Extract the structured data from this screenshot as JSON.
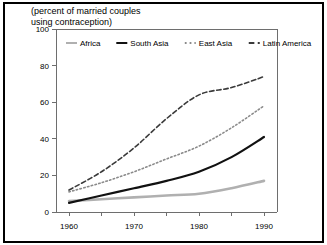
{
  "title": {
    "line1": "(percent of married couples",
    "line2": "using contraception)"
  },
  "chart_data": {
    "type": "line",
    "title": "(percent of married couples using contraception)",
    "xlabel": "",
    "ylabel": "",
    "xlim": [
      1958,
      1992
    ],
    "ylim": [
      0,
      100
    ],
    "grid": false,
    "legend_position": "top-inside",
    "x_ticks": [
      1960,
      1970,
      1980,
      1990
    ],
    "x_minor_ticks": [
      1965,
      1975,
      1985
    ],
    "y_ticks": [
      0,
      20,
      40,
      60,
      80,
      100
    ],
    "x": [
      1960,
      1965,
      1970,
      1975,
      1980,
      1985,
      1990
    ],
    "series": [
      {
        "name": "Africa",
        "style": "solid",
        "color": "#b0b0b0",
        "width": 2.6,
        "values": [
          6,
          7,
          8,
          9,
          10,
          13,
          17
        ]
      },
      {
        "name": "South Asia",
        "style": "solid",
        "color": "#111111",
        "width": 2.2,
        "values": [
          5,
          9,
          13,
          17,
          22,
          30,
          41
        ]
      },
      {
        "name": "East Asia",
        "style": "dotted",
        "color": "#8a8a8a",
        "width": 1.6,
        "values": [
          11,
          16,
          22,
          29,
          36,
          46,
          58
        ]
      },
      {
        "name": "Latin America",
        "style": "dashed",
        "color": "#3a3a3a",
        "width": 1.6,
        "values": [
          12,
          22,
          35,
          51,
          64,
          68,
          74
        ]
      }
    ]
  },
  "legend": {
    "items": [
      {
        "label": "Africa",
        "style": "solid",
        "color": "#b0b0b0"
      },
      {
        "label": "South Asia",
        "style": "solid",
        "color": "#111111"
      },
      {
        "label": "East Asia",
        "style": "dotted",
        "color": "#8a8a8a"
      },
      {
        "label": "Latin America",
        "style": "dashed",
        "color": "#3a3a3a"
      }
    ]
  }
}
